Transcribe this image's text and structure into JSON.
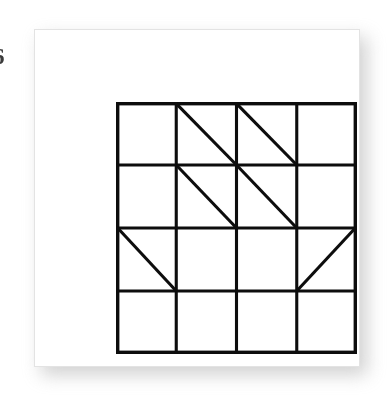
{
  "figure": {
    "kind": "grid-diagram",
    "edge_label": "6",
    "background_color": "#ffffff",
    "card": {
      "background_color": "#ffffff",
      "border_color": "#e3e3e3",
      "shadow_color": "#b9b9b9",
      "x": 34,
      "y": 29,
      "width": 326,
      "height": 338
    },
    "grid": {
      "rows": 4,
      "columns": 4,
      "line_color": "#0d0d0d",
      "line_width": 3,
      "x": 81,
      "y": 72,
      "width": 241,
      "height": 252,
      "cell_width": 60.25,
      "cell_height": 63.0,
      "x_positions": [
        81,
        141,
        201,
        261,
        322
      ],
      "y_positions": [
        72,
        135,
        198,
        261,
        324
      ]
    },
    "cells": [
      {
        "row": 1,
        "col": 1,
        "diagonal": "none"
      },
      {
        "row": 1,
        "col": 2,
        "diagonal": "main"
      },
      {
        "row": 1,
        "col": 3,
        "diagonal": "main"
      },
      {
        "row": 1,
        "col": 4,
        "diagonal": "none"
      },
      {
        "row": 2,
        "col": 1,
        "diagonal": "none"
      },
      {
        "row": 2,
        "col": 2,
        "diagonal": "main"
      },
      {
        "row": 2,
        "col": 3,
        "diagonal": "main"
      },
      {
        "row": 2,
        "col": 4,
        "diagonal": "none"
      },
      {
        "row": 3,
        "col": 1,
        "diagonal": "main"
      },
      {
        "row": 3,
        "col": 2,
        "diagonal": "none"
      },
      {
        "row": 3,
        "col": 3,
        "diagonal": "none"
      },
      {
        "row": 3,
        "col": 4,
        "diagonal": "anti"
      },
      {
        "row": 4,
        "col": 1,
        "diagonal": "none"
      },
      {
        "row": 4,
        "col": 2,
        "diagonal": "none"
      },
      {
        "row": 4,
        "col": 3,
        "diagonal": "none"
      },
      {
        "row": 4,
        "col": 4,
        "diagonal": "none"
      }
    ],
    "diagonal_count": 6,
    "triangle_count": 12
  }
}
